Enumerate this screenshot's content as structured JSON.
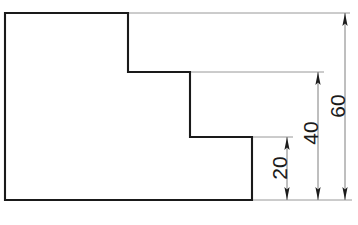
{
  "drawing": {
    "title": "Stepped profile elevation with vertical dimensions",
    "background_color": "#ffffff",
    "outline_color": "#1a1a1a",
    "dimension_line_color": "#6f6f6f",
    "extension_line_color": "#8d8d8d",
    "arrow_color": "#1c1c1c",
    "units": "mm",
    "projection": "front-view",
    "outline": {
      "name": "stepped-L-profile",
      "vertex_count": 8,
      "points": "5,13 128,13 128,72 190,72 190,137 252,137 252,200 5,200",
      "closed": true
    },
    "dimensions": [
      {
        "id": "dim-20",
        "label": "20",
        "value": 20,
        "orientation": "vertical",
        "text_rotation_deg": -90,
        "line_x": 287,
        "top_y": 137,
        "bottom_y": 200,
        "text_x": 281,
        "text_y": 168,
        "measures": "lower step height from base to first ledge"
      },
      {
        "id": "dim-40",
        "label": "40",
        "value": 40,
        "orientation": "vertical",
        "text_rotation_deg": -90,
        "line_x": 318,
        "top_y": 72,
        "bottom_y": 200,
        "text_x": 312,
        "text_y": 133,
        "measures": "mid step height from base to second ledge"
      },
      {
        "id": "dim-60",
        "label": "60",
        "value": 60,
        "orientation": "vertical",
        "text_rotation_deg": -90,
        "line_x": 345,
        "top_y": 13,
        "bottom_y": 200,
        "text_x": 339,
        "text_y": 106,
        "measures": "overall height from base to top face"
      }
    ],
    "extension_lines": [
      {
        "id": "ext-top",
        "x1": 128,
        "y1": 13,
        "x2": 350,
        "y2": 13,
        "from": "top-face"
      },
      {
        "id": "ext-mid",
        "x1": 190,
        "y1": 72,
        "x2": 324,
        "y2": 72,
        "from": "second-ledge"
      },
      {
        "id": "ext-low",
        "x1": 252,
        "y1": 137,
        "x2": 293,
        "y2": 137,
        "from": "first-ledge"
      },
      {
        "id": "ext-baseline",
        "x1": 252,
        "y1": 200,
        "x2": 352,
        "y2": 200,
        "from": "base-face"
      }
    ]
  }
}
